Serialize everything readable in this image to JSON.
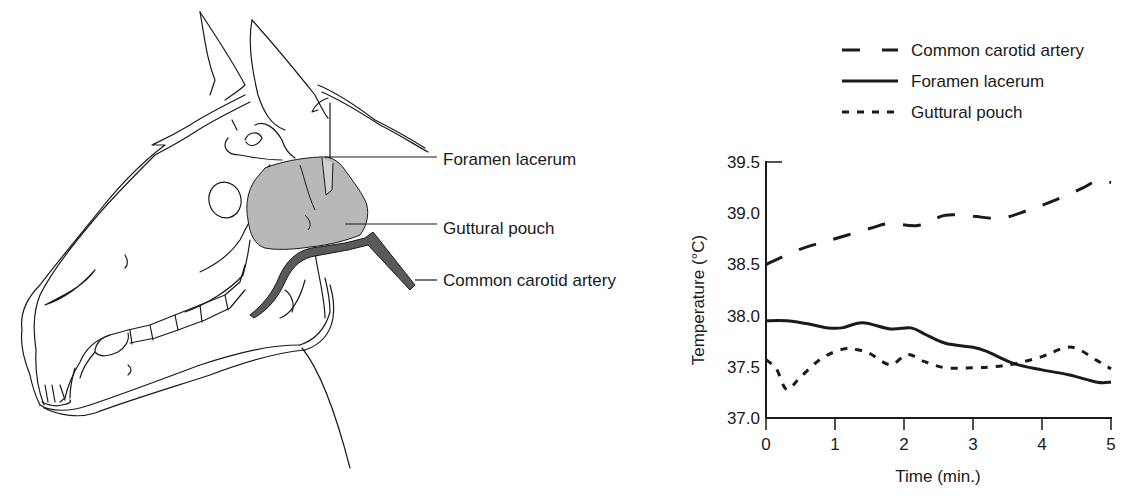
{
  "diagram": {
    "labels": [
      {
        "id": "foramen",
        "text": "Foramen lacerum",
        "x": 443,
        "y": 165
      },
      {
        "id": "guttural",
        "text": "Guttural pouch",
        "x": 443,
        "y": 234
      },
      {
        "id": "carotid",
        "text": "Common carotid artery",
        "x": 443,
        "y": 286
      }
    ],
    "colors": {
      "pouch_fill": "#b8b8b8",
      "artery_fill": "#5a5a5a",
      "line": "#1a1a1a"
    }
  },
  "chart_data": {
    "type": "line",
    "title": "",
    "xlabel": "Time (min.)",
    "ylabel": "Temperature (°C)",
    "xlim": [
      0,
      5
    ],
    "ylim": [
      37.0,
      39.5
    ],
    "x_ticks": [
      "0",
      "1",
      "2",
      "3",
      "4",
      "5"
    ],
    "y_ticks": [
      "37.0",
      "37.5",
      "38.0",
      "38.5",
      "39.0",
      "39.5"
    ],
    "grid": false,
    "legend_position": "top-right, above plot",
    "series": [
      {
        "name": "Common carotid artery",
        "style": "long-dash",
        "x": [
          0,
          0.5,
          1.0,
          1.5,
          1.8,
          2.2,
          2.6,
          3.0,
          3.4,
          3.8,
          4.2,
          4.6,
          4.8,
          5.0
        ],
        "values": [
          38.5,
          38.65,
          38.75,
          38.85,
          38.9,
          38.88,
          38.98,
          38.97,
          38.95,
          39.03,
          39.13,
          39.25,
          39.32,
          39.3
        ]
      },
      {
        "name": "Foramen lacerum",
        "style": "solid",
        "x": [
          0,
          0.3,
          0.6,
          0.9,
          1.1,
          1.4,
          1.8,
          2.1,
          2.3,
          2.6,
          3.0,
          3.2,
          3.6,
          4.0,
          4.4,
          4.8,
          5.0
        ],
        "values": [
          37.95,
          37.95,
          37.92,
          37.88,
          37.88,
          37.93,
          37.87,
          37.88,
          37.82,
          37.73,
          37.69,
          37.65,
          37.53,
          37.47,
          37.42,
          37.35,
          37.35
        ]
      },
      {
        "name": "Guttural pouch",
        "style": "short-dash",
        "x": [
          0,
          0.15,
          0.3,
          0.5,
          0.8,
          1.1,
          1.3,
          1.5,
          1.8,
          2.05,
          2.3,
          2.6,
          3.0,
          3.3,
          3.6,
          4.0,
          4.3,
          4.5,
          4.8,
          5.0
        ],
        "values": [
          37.57,
          37.48,
          37.28,
          37.4,
          37.58,
          37.67,
          37.67,
          37.63,
          37.52,
          37.62,
          37.55,
          37.49,
          37.49,
          37.5,
          37.53,
          37.6,
          37.68,
          37.68,
          37.56,
          37.48
        ]
      }
    ]
  },
  "legend": {
    "items": [
      {
        "label": "Common carotid artery",
        "style": "long-dash"
      },
      {
        "label": "Foramen lacerum",
        "style": "solid"
      },
      {
        "label": "Guttural pouch",
        "style": "short-dash"
      }
    ]
  }
}
